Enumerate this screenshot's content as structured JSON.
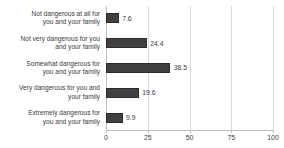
{
  "chart_data": {
    "type": "bar",
    "orientation": "horizontal",
    "title": "",
    "subtitle": "",
    "xlabel": "",
    "ylabel": "",
    "xlim": [
      0,
      100
    ],
    "xticks": [
      "0",
      "25",
      "50",
      "75",
      "100"
    ],
    "xtick_values": [
      0,
      25,
      50,
      75,
      100
    ],
    "grid": true,
    "grid_axis": "x",
    "legend": false,
    "bar_color": "#404040",
    "text_color": "#3a3a3a",
    "gridline_color": "#d9d9d9",
    "axis_color": "#bfbfbf",
    "background": "#ffffff",
    "categories": [
      "Not dangerous at all for you and your family",
      "Not very dangerous for you and your family",
      "Somewhat dangerous for you and your family",
      "Very dangerous for you and your family",
      "Extremely dangerous for you and your family"
    ],
    "category_lines": [
      [
        "Not dangerous at all for",
        "you and your family"
      ],
      [
        "Not very dangerous for you",
        "and your family"
      ],
      [
        "Somewhat dangerous for",
        "you and your family"
      ],
      [
        "Very dangerous for you and",
        "your family"
      ],
      [
        "Extremely dangerous for",
        "you and your family"
      ]
    ],
    "values": [
      7.6,
      24.4,
      38.5,
      19.6,
      9.9
    ],
    "value_labels": [
      "7.6",
      "24.4",
      "38.5",
      "19.6",
      "9.9"
    ]
  }
}
